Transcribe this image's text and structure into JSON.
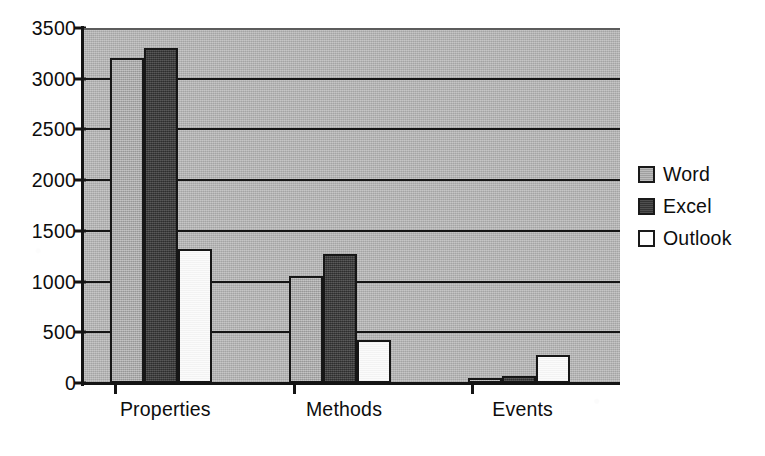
{
  "chart_data": {
    "type": "bar",
    "title": "",
    "subtitle": "",
    "xlabel": "",
    "ylabel": "",
    "categories": [
      "Properties",
      "Methods",
      "Events"
    ],
    "series": [
      {
        "name": "Word",
        "color": "#a9a9a9",
        "values": [
          3200,
          1060,
          50
        ]
      },
      {
        "name": "Excel",
        "color": "#3b3b3b",
        "values": [
          3300,
          1270,
          70
        ]
      },
      {
        "name": "Outlook",
        "color": "#ffffff",
        "values": [
          1320,
          420,
          280
        ]
      }
    ],
    "ylim": [
      0,
      3500
    ],
    "ytick_labels": [
      "0",
      "500",
      "1000",
      "1500",
      "2000",
      "2500",
      "3000",
      "3500"
    ],
    "ytick_values": [
      0,
      500,
      1000,
      1500,
      2000,
      2500,
      3000,
      3500
    ],
    "grid": true,
    "grid_axis": "y",
    "legend_position": "right",
    "plot_background": "#b4b4b4",
    "gridline_color": "#151515",
    "axis_color": "#141414"
  },
  "legend": {
    "entries": [
      {
        "label": "Word"
      },
      {
        "label": "Excel"
      },
      {
        "label": "Outlook"
      }
    ]
  }
}
